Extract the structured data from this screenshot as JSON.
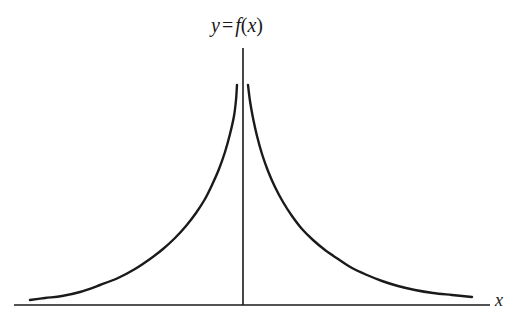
{
  "figure": {
    "background_color": "#ffffff",
    "ink_color": "#1a1a1a",
    "width": 516,
    "height": 327
  },
  "labels": {
    "curve_label": {
      "full_text": "y = f(x)",
      "y_symbol": "y",
      "equals_sign": "=",
      "f_symbol": "f",
      "open_paren": "(",
      "x_symbol": "x",
      "close_paren": ")"
    },
    "x_axis_label": "x"
  },
  "chart_data": {
    "type": "line",
    "xlabel": "x",
    "ylabel": "",
    "grid": false,
    "legend": false,
    "axes": {
      "x_axis": {
        "y_pixel": 305,
        "x_start_pixel": 14,
        "x_end_pixel": 490,
        "stroke_width": 1.6
      },
      "y_axis": {
        "x_pixel": 243,
        "y_start_pixel": 48,
        "y_end_pixel": 305,
        "stroke_width": 1.6
      }
    },
    "asymptotes": {
      "vertical_at_x_pixel": 243,
      "horizontal_at_y_pixel": 305
    },
    "series": [
      {
        "name": "left-branch",
        "stroke_width": 2.4,
        "points": [
          [
            30,
            300
          ],
          [
            45,
            298
          ],
          [
            62,
            296
          ],
          [
            80,
            292
          ],
          [
            100,
            285
          ],
          [
            118,
            278
          ],
          [
            135,
            269
          ],
          [
            150,
            259
          ],
          [
            163,
            249
          ],
          [
            175,
            238
          ],
          [
            186,
            226
          ],
          [
            196,
            213
          ],
          [
            205,
            199
          ],
          [
            212,
            185
          ],
          [
            219,
            169
          ],
          [
            225,
            152
          ],
          [
            230,
            134
          ],
          [
            234,
            116
          ],
          [
            236,
            100
          ],
          [
            237,
            85
          ]
        ]
      },
      {
        "name": "right-branch",
        "stroke_width": 2.4,
        "points": [
          [
            248,
            85
          ],
          [
            250,
            101
          ],
          [
            253,
            118
          ],
          [
            257,
            136
          ],
          [
            262,
            154
          ],
          [
            268,
            171
          ],
          [
            275,
            187
          ],
          [
            283,
            202
          ],
          [
            292,
            216
          ],
          [
            302,
            229
          ],
          [
            313,
            240
          ],
          [
            325,
            250
          ],
          [
            338,
            259
          ],
          [
            352,
            268
          ],
          [
            367,
            275
          ],
          [
            382,
            281
          ],
          [
            398,
            286
          ],
          [
            415,
            290
          ],
          [
            433,
            293
          ],
          [
            452,
            295
          ],
          [
            472,
            297
          ]
        ]
      }
    ]
  }
}
